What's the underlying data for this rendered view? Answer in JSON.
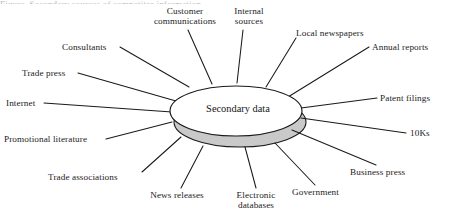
{
  "figure": {
    "title_truncated": "Figure  Secondary sources of competitor information",
    "center_label": "Secondary data",
    "background_color": "#ffffff",
    "line_color": "#1a1a1a",
    "disc_fill": "#ffffff",
    "disc_shadow_fill": "#c9c9c9"
  },
  "nodes": [
    {
      "id": "customer-communications",
      "label": "Customer\ncommunications",
      "align": "ctr",
      "x": 148,
      "y": 6,
      "w": 74,
      "leader_from": [
        188,
        30
      ],
      "leader_to": [
        212,
        84
      ]
    },
    {
      "id": "internal-sources",
      "label": "Internal\nsources",
      "align": "ctr",
      "x": 226,
      "y": 6,
      "w": 46,
      "leader_from": [
        243,
        30
      ],
      "leader_to": [
        237,
        83
      ]
    },
    {
      "id": "local-newspapers",
      "label": "Local newspapers",
      "align": "left",
      "x": 296,
      "y": 28,
      "w": 84,
      "leader_from": [
        296,
        38
      ],
      "leader_to": [
        266,
        87
      ]
    },
    {
      "id": "annual-reports",
      "label": "Annual reports",
      "align": "left",
      "x": 372,
      "y": 42,
      "w": 76,
      "leader_from": [
        369,
        47
      ],
      "leader_to": [
        288,
        97
      ]
    },
    {
      "id": "patent-filings",
      "label": "Patent filings",
      "align": "left",
      "x": 380,
      "y": 93,
      "w": 72,
      "leader_from": [
        377,
        98
      ],
      "leader_to": [
        301,
        108
      ]
    },
    {
      "id": "10ks",
      "label": "10Ks",
      "align": "left",
      "x": 410,
      "y": 128,
      "w": 40,
      "leader_from": [
        406,
        133
      ],
      "leader_to": [
        301,
        118
      ]
    },
    {
      "id": "business-press",
      "label": "Business press",
      "align": "left",
      "x": 350,
      "y": 167,
      "w": 74,
      "leader_from": [
        376,
        165
      ],
      "leader_to": [
        292,
        130
      ]
    },
    {
      "id": "government",
      "label": "Government",
      "align": "left",
      "x": 292,
      "y": 187,
      "w": 60,
      "leader_from": [
        315,
        185
      ],
      "leader_to": [
        275,
        143
      ]
    },
    {
      "id": "electronic-databases",
      "label": "Electronic\ndatabases",
      "align": "ctr",
      "x": 228,
      "y": 190,
      "w": 56,
      "leader_from": [
        256,
        188
      ],
      "leader_to": [
        245,
        147
      ]
    },
    {
      "id": "news-releases",
      "label": "News releases",
      "align": "ctr",
      "x": 142,
      "y": 190,
      "w": 70,
      "leader_from": [
        181,
        188
      ],
      "leader_to": [
        203,
        146
      ]
    },
    {
      "id": "trade-associations",
      "label": "Trade associations",
      "align": "left",
      "x": 48,
      "y": 172,
      "w": 92,
      "leader_from": [
        142,
        172
      ],
      "leader_to": [
        181,
        137
      ]
    },
    {
      "id": "promotional-literature",
      "label": "Promotional literature",
      "align": "left",
      "x": 4,
      "y": 134,
      "w": 104,
      "leader_from": [
        106,
        139
      ],
      "leader_to": [
        172,
        122
      ]
    },
    {
      "id": "internet",
      "label": "Internet",
      "align": "left",
      "x": 6,
      "y": 98,
      "w": 44,
      "leader_from": [
        44,
        103
      ],
      "leader_to": [
        172,
        112
      ]
    },
    {
      "id": "trade-press",
      "label": "Trade press",
      "align": "left",
      "x": 22,
      "y": 68,
      "w": 60,
      "leader_from": [
        78,
        73
      ],
      "leader_to": [
        176,
        101
      ]
    },
    {
      "id": "consultants",
      "label": "Consultants",
      "align": "left",
      "x": 62,
      "y": 42,
      "w": 62,
      "leader_from": [
        120,
        47
      ],
      "leader_to": [
        189,
        87
      ]
    }
  ]
}
